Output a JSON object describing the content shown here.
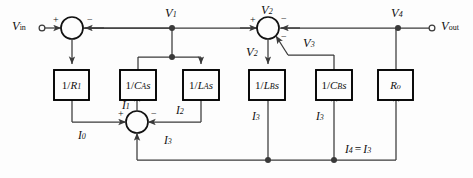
{
  "diagram": {
    "type": "signal-flow block diagram",
    "colors": {
      "line": "#3a3a3a",
      "block_border": "#000000",
      "text": "#111111",
      "background": "#fdfdfd"
    },
    "terminals": [
      {
        "name": "input-terminal",
        "label_main": "V",
        "label_sub": "in",
        "x": 30,
        "y": 28
      },
      {
        "name": "output-terminal",
        "label_main": "V",
        "label_sub": "out",
        "x": 440,
        "y": 28
      }
    ],
    "nodes": [
      {
        "name": "node-v1",
        "label_main": "V",
        "label_sub": "1",
        "x": 172,
        "y": 28
      },
      {
        "name": "node-v4",
        "label_main": "V",
        "label_sub": "4",
        "x": 398,
        "y": 28
      }
    ],
    "summing_junctions": [
      {
        "name": "summing-junction-input",
        "x": 72,
        "y": 28,
        "output_label": "",
        "signs": [
          {
            "position": "left",
            "sign": "+"
          },
          {
            "position": "right",
            "sign": "−"
          }
        ]
      },
      {
        "name": "summing-junction-v2",
        "x": 268,
        "y": 28,
        "label_main": "V",
        "label_sub": "2",
        "output_label_main": "V",
        "output_label_sub": "2",
        "signs": [
          {
            "position": "left",
            "sign": "+"
          },
          {
            "position": "upper-right",
            "sign": "−"
          },
          {
            "position": "lower-right",
            "sign": "−"
          }
        ]
      },
      {
        "name": "summing-junction-current",
        "x": 137,
        "y": 122,
        "signs": [
          {
            "position": "left",
            "sign": "+"
          },
          {
            "position": "right",
            "sign": "−"
          }
        ]
      }
    ],
    "blocks": [
      {
        "name": "block-inv-r1",
        "num": "1/",
        "var": "R",
        "sub": "1",
        "tail": "",
        "x": 54,
        "y": 70,
        "w": 35,
        "h": 30
      },
      {
        "name": "block-inv-cas",
        "num": "1/",
        "var": "C",
        "sub": "A",
        "tail": "s",
        "x": 120,
        "y": 70,
        "w": 36,
        "h": 30
      },
      {
        "name": "block-inv-las",
        "num": "1/",
        "var": "L",
        "sub": "A",
        "tail": "s",
        "x": 183,
        "y": 70,
        "w": 36,
        "h": 30
      },
      {
        "name": "block-inv-lbs",
        "num": "1/",
        "var": "L",
        "sub": "B",
        "tail": "s",
        "x": 249,
        "y": 70,
        "w": 36,
        "h": 30
      },
      {
        "name": "block-inv-cbs",
        "num": "1/",
        "var": "C",
        "sub": "B",
        "tail": "s",
        "x": 316,
        "y": 70,
        "w": 36,
        "h": 30
      },
      {
        "name": "block-ro",
        "num": "",
        "var": "R",
        "sub": "o",
        "tail": "",
        "x": 378,
        "y": 70,
        "w": 35,
        "h": 30
      }
    ],
    "signal_labels": [
      {
        "name": "signal-v3",
        "main": "V",
        "sub": "3",
        "x": 302,
        "y": 42
      },
      {
        "name": "signal-v2-out",
        "main": "V",
        "sub": "2",
        "x": 248,
        "y": 52
      },
      {
        "name": "signal-i0",
        "main": "I",
        "sub": "0",
        "x": 80,
        "y": 136
      },
      {
        "name": "signal-i1",
        "main": "I",
        "sub": "1",
        "x": 124,
        "y": 106
      },
      {
        "name": "signal-i2",
        "main": "I",
        "sub": "2",
        "x": 178,
        "y": 110
      },
      {
        "name": "signal-i3-junction",
        "main": "I",
        "sub": "3",
        "x": 166,
        "y": 140
      },
      {
        "name": "signal-i3-lb",
        "main": "I",
        "sub": "3",
        "x": 254,
        "y": 116
      },
      {
        "name": "signal-i3-cb",
        "main": "I",
        "sub": "3",
        "x": 318,
        "y": 116
      },
      {
        "name": "signal-i4",
        "main": "I",
        "sub": "4",
        "eq": "=",
        "main2": "I",
        "sub2": "3",
        "x": 347,
        "y": 150
      }
    ]
  }
}
